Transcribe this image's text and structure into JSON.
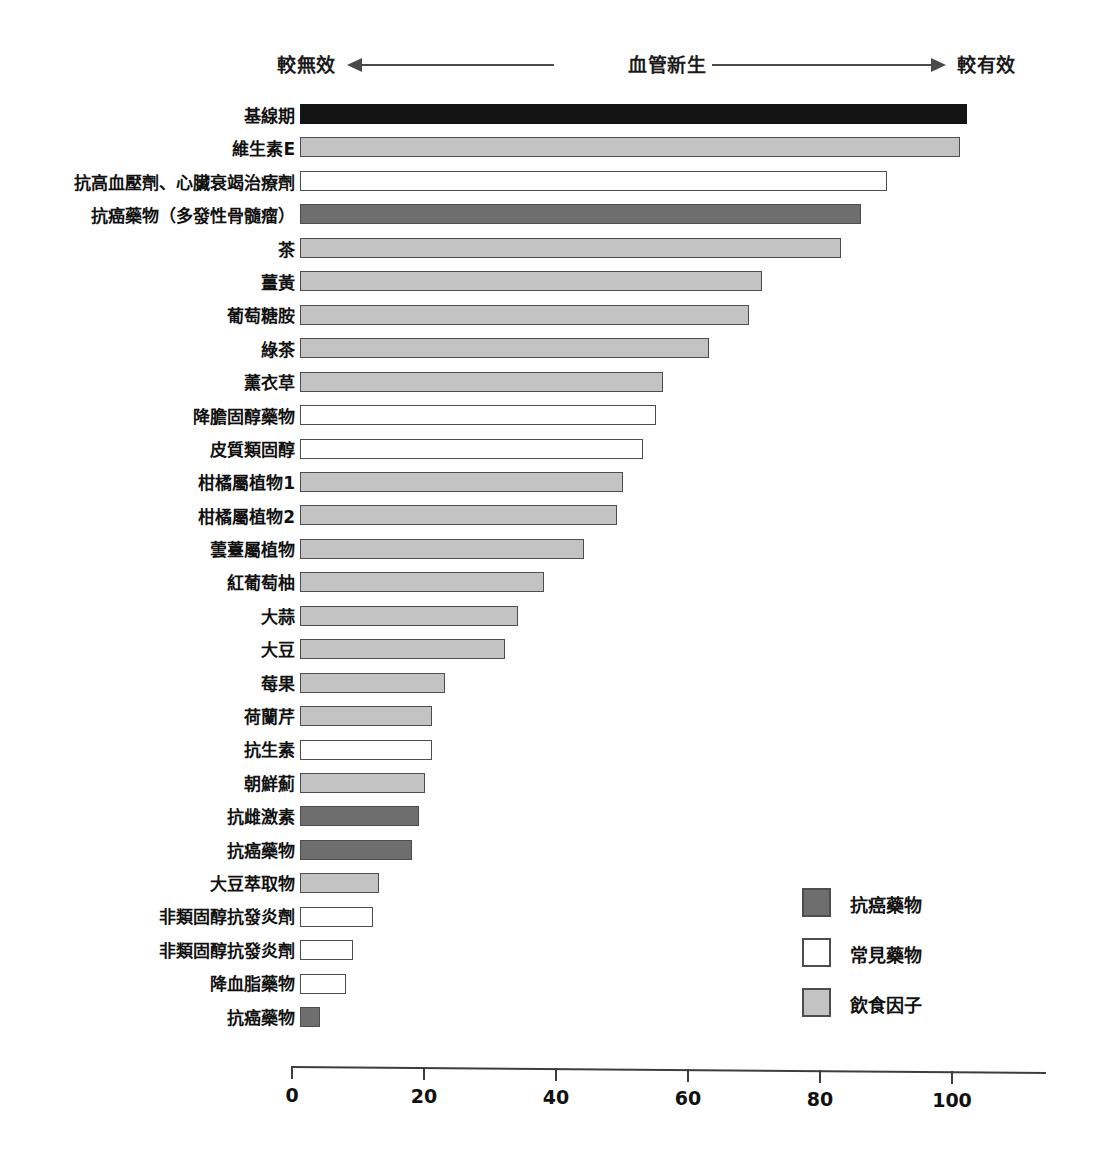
{
  "header": {
    "left_label": "較無效",
    "middle_label": "血管新生",
    "right_label": "較有效",
    "left_arrow_icon": "arrow-left-icon",
    "right_arrow_icon": "arrow-right-icon"
  },
  "legend": {
    "items": [
      {
        "label": "抗癌藥物",
        "key": "cancer",
        "color": "#6e6e6e"
      },
      {
        "label": "常見藥物",
        "key": "drug",
        "color": "#ffffff"
      },
      {
        "label": "飲食因子",
        "key": "diet",
        "color": "#c3c3c3"
      }
    ]
  },
  "chart_data": {
    "type": "bar",
    "orientation": "horizontal",
    "title": "",
    "subtitle": "",
    "xlabel": "血管新生",
    "ylabel": "",
    "xlim": [
      0,
      114
    ],
    "xticks": [
      0,
      20,
      40,
      60,
      80,
      100
    ],
    "xticklabels": [
      "0",
      "20",
      "40",
      "60",
      "80",
      "100"
    ],
    "grid": false,
    "legend_position": "inside-right",
    "annotations": [
      "較無效",
      "血管新生",
      "較有效"
    ],
    "categories": [
      "基線期",
      "維生素E",
      "抗高血壓劑、心臟衰竭治療劑",
      "抗癌藥物（多發性骨髓瘤）",
      "茶",
      "薑黃",
      "葡萄糖胺",
      "綠茶",
      "薰衣草",
      "降膽固醇藥物",
      "皮質類固醇",
      "柑橘屬植物1",
      "柑橘屬植物2",
      "蕓薹屬植物",
      "紅葡萄柚",
      "大蒜",
      "大豆",
      "莓果",
      "荷蘭芹",
      "抗生素",
      "朝鮮薊",
      "抗雌激素",
      "抗癌藥物",
      "大豆萃取物",
      "非類固醇抗發炎劑",
      "非類固醇抗發炎劑",
      "降血脂藥物",
      "抗癌藥物"
    ],
    "values": [
      101,
      100,
      89,
      85,
      82,
      70,
      68,
      62,
      55,
      54,
      52,
      49,
      48,
      43,
      37,
      33,
      31,
      22,
      20,
      20,
      19,
      18,
      17,
      12,
      11,
      8,
      7,
      3
    ],
    "group": [
      "baseline",
      "diet",
      "drug",
      "cancer",
      "diet",
      "diet",
      "diet",
      "diet",
      "diet",
      "drug",
      "drug",
      "diet",
      "diet",
      "diet",
      "diet",
      "diet",
      "diet",
      "diet",
      "diet",
      "drug",
      "diet",
      "cancer",
      "cancer",
      "diet",
      "drug",
      "drug",
      "drug",
      "cancer"
    ]
  }
}
